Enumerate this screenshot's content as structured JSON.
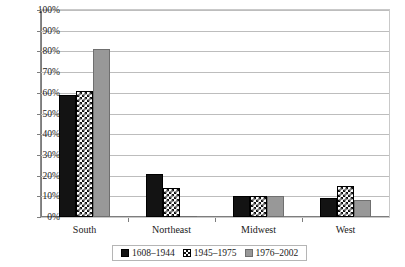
{
  "chart_data": {
    "type": "bar",
    "title": "",
    "xlabel": "",
    "ylabel": "",
    "ylim": [
      0,
      100
    ],
    "yticks": [
      "0%",
      "10%",
      "20%",
      "30%",
      "40%",
      "50%",
      "60%",
      "70%",
      "80%",
      "90%",
      "100%"
    ],
    "ytick_values": [
      0,
      10,
      20,
      30,
      40,
      50,
      60,
      70,
      80,
      90,
      100
    ],
    "grid": true,
    "legend_position": "bottom",
    "categories": [
      "South",
      "Northeast",
      "Midwest",
      "West"
    ],
    "series": [
      {
        "name": "1608–1944",
        "color": "#131313",
        "pattern": "solid-black",
        "values": [
          59,
          21,
          10,
          9
        ]
      },
      {
        "name": "1945–1975",
        "color": "#ffffff",
        "pattern": "checkerboard",
        "values": [
          61,
          14,
          10,
          15
        ]
      },
      {
        "name": "1976–2002",
        "color": "#989898",
        "pattern": "solid-gray",
        "values": [
          81,
          0.5,
          10,
          8
        ]
      }
    ]
  },
  "legend": {
    "items": [
      {
        "label": "1608–1944"
      },
      {
        "label": "1945–1975"
      },
      {
        "label": "1976–2002"
      }
    ]
  }
}
